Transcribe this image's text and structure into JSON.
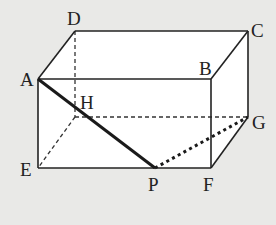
{
  "figure": {
    "type": "rectangular-prism",
    "vertices": {
      "A": {
        "label": "A",
        "x": 38,
        "y": 79
      },
      "B": {
        "label": "B",
        "x": 211,
        "y": 79
      },
      "C": {
        "label": "C",
        "x": 248,
        "y": 31
      },
      "D": {
        "label": "D",
        "x": 75,
        "y": 31
      },
      "E": {
        "label": "E",
        "x": 38,
        "y": 168
      },
      "F": {
        "label": "F",
        "x": 211,
        "y": 168
      },
      "G": {
        "label": "G",
        "x": 248,
        "y": 117
      },
      "H": {
        "label": "H",
        "x": 75,
        "y": 117
      },
      "P": {
        "label": "P",
        "x": 155,
        "y": 168
      }
    },
    "visible_edges": [
      "AB",
      "BC",
      "CD",
      "DA",
      "AE",
      "EF",
      "BF",
      "CG",
      "FG"
    ],
    "hidden_edges": [
      "DH",
      "EH",
      "GH"
    ],
    "highlighted_segments": [
      {
        "name": "AP",
        "style": "thick-solid"
      },
      {
        "name": "PG",
        "style": "thick-dotted"
      }
    ],
    "colors": {
      "background": "#e9e9e7",
      "face": "#ffffff",
      "line": "#222222"
    }
  }
}
